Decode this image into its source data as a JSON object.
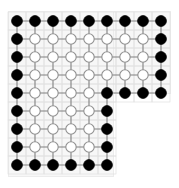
{
  "figure": {
    "title": "",
    "caption": "",
    "background_color": "#ffffff",
    "panel_color": "#f7f7f7",
    "panel_border_color": "#ececec",
    "background_grid_color": "#e0e0e0",
    "edge_color": "#808080",
    "boundary_node_fill": "#000000",
    "boundary_node_stroke": "#000000",
    "interior_node_fill": "#ffffff",
    "interior_node_stroke": "#909090"
  },
  "chart_data": {
    "type": "scatter",
    "title": "",
    "subtitle": "",
    "xlabel": "",
    "ylabel": "",
    "xlim": [
      0,
      8
    ],
    "ylim": [
      0,
      8
    ],
    "grid": true,
    "legend": null,
    "geometry": {
      "grid_columns": 9,
      "grid_rows": 9,
      "node_spacing_px": 18,
      "origin_px": [
        17,
        21
      ],
      "node_radius_px": 5.2,
      "boundary_node_radius_px": 5.4,
      "notch": {
        "removed_min_col": 6,
        "removed_min_row": 5,
        "step_col": 5,
        "step_row": 4
      }
    },
    "counts": {
      "total_nodes": 69,
      "boundary_nodes": 32,
      "interior_nodes": 37,
      "total_edges": 116
    },
    "rows": [
      {
        "row": 0,
        "cells": [
          "boundary",
          "boundary",
          "boundary",
          "boundary",
          "boundary",
          "boundary",
          "boundary",
          "boundary",
          "boundary"
        ]
      },
      {
        "row": 1,
        "cells": [
          "boundary",
          "interior",
          "interior",
          "interior",
          "interior",
          "interior",
          "interior",
          "interior",
          "boundary"
        ]
      },
      {
        "row": 2,
        "cells": [
          "boundary",
          "interior",
          "interior",
          "interior",
          "interior",
          "interior",
          "interior",
          "interior",
          "boundary"
        ]
      },
      {
        "row": 3,
        "cells": [
          "boundary",
          "interior",
          "interior",
          "interior",
          "interior",
          "interior",
          "interior",
          "interior",
          "boundary"
        ]
      },
      {
        "row": 4,
        "cells": [
          "boundary",
          "interior",
          "interior",
          "interior",
          "interior",
          "boundary",
          "boundary",
          "boundary",
          "boundary"
        ]
      },
      {
        "row": 5,
        "cells": [
          "boundary",
          "interior",
          "interior",
          "interior",
          "interior",
          "boundary"
        ]
      },
      {
        "row": 6,
        "cells": [
          "boundary",
          "interior",
          "interior",
          "interior",
          "interior",
          "boundary"
        ]
      },
      {
        "row": 7,
        "cells": [
          "boundary",
          "interior",
          "interior",
          "interior",
          "interior",
          "boundary"
        ]
      },
      {
        "row": 8,
        "cells": [
          "boundary",
          "boundary",
          "boundary",
          "boundary",
          "boundary",
          "boundary"
        ]
      }
    ]
  }
}
